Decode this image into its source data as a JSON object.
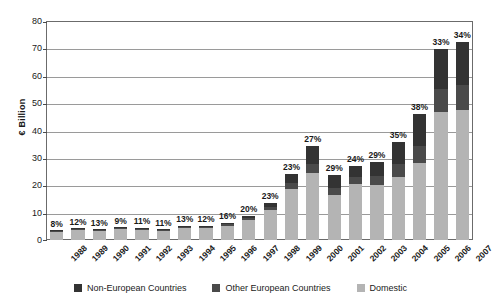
{
  "chart_data": {
    "type": "bar",
    "subtype": "stacked-bar",
    "title": "",
    "xlabel": "",
    "ylabel": "€ Billion",
    "ylim": [
      0,
      80
    ],
    "ytick_step": 10,
    "yticks": [
      "0",
      "10",
      "20",
      "30",
      "40",
      "50",
      "60",
      "70",
      "80"
    ],
    "grid": true,
    "legend_position": "bottom",
    "categories": [
      "1988",
      "1989",
      "1990",
      "1991",
      "1992",
      "1993",
      "1994",
      "1995",
      "1996",
      "1997",
      "1998",
      "1999",
      "2000",
      "2001",
      "2002",
      "2003",
      "2004",
      "2005",
      "2006",
      "2007"
    ],
    "series": [
      {
        "name": "Domestic",
        "color": "#b4b4b4",
        "values": [
          3.0,
          3.6,
          3.3,
          3.9,
          3.8,
          3.3,
          4.4,
          4.4,
          5.2,
          7.2,
          10.8,
          18.5,
          24.5,
          16.6,
          20.3,
          20.2,
          23.1,
          28.2,
          46.6,
          47.6
        ]
      },
      {
        "name": "Other European Countries",
        "color": "#4a4a4a",
        "values": [
          0.15,
          0.25,
          0.25,
          0.2,
          0.25,
          0.2,
          0.3,
          0.3,
          0.5,
          0.8,
          1.4,
          2.3,
          3.3,
          2.4,
          2.8,
          3.2,
          4.5,
          6.2,
          8.4,
          9.0
        ]
      },
      {
        "name": "Non-European Countries",
        "color": "#333333",
        "values": [
          0.1,
          0.25,
          0.2,
          0.35,
          0.2,
          0.2,
          0.4,
          0.3,
          0.5,
          0.7,
          1.5,
          3.2,
          6.4,
          4.6,
          3.9,
          5.0,
          8.3,
          11.5,
          14.9,
          15.7
        ]
      }
    ],
    "annotations": {
      "label": "non-domestic share",
      "values": [
        "8%",
        "12%",
        "13%",
        "9%",
        "11%",
        "11%",
        "13%",
        "12%",
        "16%",
        "20%",
        "23%",
        "23%",
        "27%",
        "29%",
        "24%",
        "29%",
        "35%",
        "38%",
        "33%",
        "34%"
      ]
    },
    "totals": [
      3.25,
      4.1,
      3.75,
      4.45,
      4.25,
      3.7,
      5.1,
      5.0,
      6.2,
      8.7,
      13.7,
      24.0,
      34.2,
      23.6,
      27.0,
      28.4,
      35.9,
      45.9,
      69.9,
      72.3
    ]
  },
  "legend": {
    "items": [
      {
        "label": "Non-European Countries",
        "color": "#333333",
        "swatch_name": "legend-swatch-non-european"
      },
      {
        "label": "Other European Countries",
        "color": "#4a4a4a",
        "swatch_name": "legend-swatch-other-european"
      },
      {
        "label": "Domestic",
        "color": "#b4b4b4",
        "swatch_name": "legend-swatch-domestic"
      }
    ]
  },
  "colors": {
    "axis": "#6b6b6b",
    "grid": "#9a9a9a",
    "text": "#1a1a1a",
    "background": "#ffffff"
  }
}
